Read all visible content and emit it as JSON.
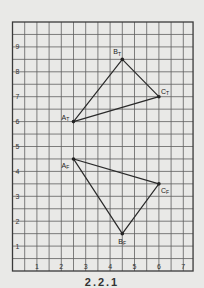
{
  "figure": {
    "background": "#e9e9e7",
    "grid_color": "#5f5f5f",
    "minor_grid_color": "#8a8a8a",
    "line_color": "#2a2a2a",
    "x_axis": {
      "min": 0,
      "max": 7.4,
      "ticks": [
        "1",
        "2",
        "3",
        "4",
        "5",
        "6",
        "7"
      ]
    },
    "y_axis": {
      "min": 0,
      "max": 10,
      "ticks": [
        "1",
        "2",
        "3",
        "4",
        "5",
        "6",
        "7",
        "8",
        "9"
      ]
    },
    "grid_step": 0.5,
    "triangles": [
      {
        "name": "upper",
        "points": [
          {
            "label": "A",
            "sub": "T",
            "x": 2.5,
            "y": 6.0
          },
          {
            "label": "B",
            "sub": "T",
            "x": 4.5,
            "y": 8.5
          },
          {
            "label": "C",
            "sub": "T",
            "x": 6.0,
            "y": 7.0
          }
        ]
      },
      {
        "name": "lower",
        "points": [
          {
            "label": "A",
            "sub": "F",
            "x": 2.5,
            "y": 4.5
          },
          {
            "label": "B",
            "sub": "F",
            "x": 4.5,
            "y": 1.5
          },
          {
            "label": "C",
            "sub": "F",
            "x": 6.0,
            "y": 3.5
          }
        ]
      }
    ],
    "caption": "2.2.1"
  }
}
